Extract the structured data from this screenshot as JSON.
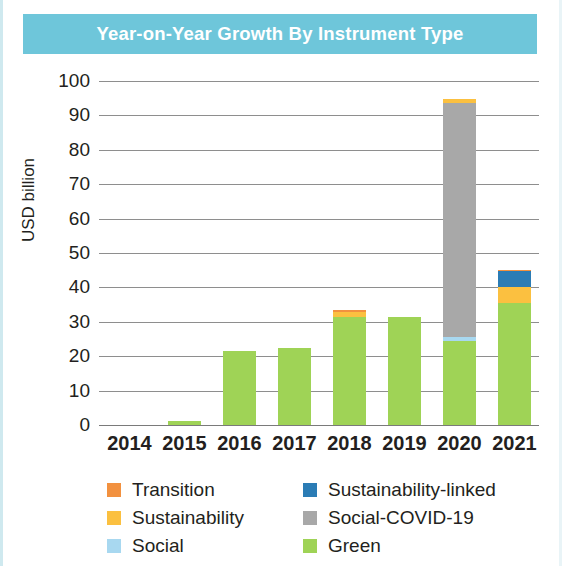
{
  "title": "Year-on-Year Growth By Instrument Type",
  "colors": {
    "title_band": "#6ec6da",
    "transition": "#f2913f",
    "sustainability": "#fbc040",
    "social": "#a8d8f0",
    "sustainability_linked": "#2b7cb5",
    "social_covid_19": "#a8a8a8",
    "green": "#9fd356"
  },
  "legend": {
    "left": [
      {
        "label": "Transition",
        "color_key": "transition"
      },
      {
        "label": "Sustainability",
        "color_key": "sustainability"
      },
      {
        "label": "Social",
        "color_key": "social"
      }
    ],
    "right": [
      {
        "label": "Sustainability-linked",
        "color_key": "sustainability_linked"
      },
      {
        "label": "Social-COVID-19",
        "color_key": "social_covid_19"
      },
      {
        "label": "Green",
        "color_key": "green"
      }
    ]
  },
  "chart_data": {
    "type": "bar",
    "subtype": "stacked",
    "title": "Year-on-Year Growth By Instrument Type",
    "xlabel": "",
    "ylabel": "USD billion",
    "ylim": [
      0,
      100
    ],
    "yticks": [
      0,
      10,
      20,
      30,
      40,
      50,
      60,
      70,
      80,
      90,
      100
    ],
    "ytick_labels": [
      "0",
      "10",
      "20",
      "30",
      "40",
      "50",
      "60",
      "70",
      "80",
      "90",
      "100"
    ],
    "grid": true,
    "legend_position": "bottom",
    "categories": [
      "2014",
      "2015",
      "2016",
      "2017",
      "2018",
      "2019",
      "2020",
      "2021"
    ],
    "series": [
      {
        "name": "Green",
        "color_key": "green",
        "values": [
          0,
          1.3,
          21.5,
          22.5,
          31.5,
          31.5,
          24.5,
          35.5
        ]
      },
      {
        "name": "Social",
        "color_key": "social",
        "values": [
          0,
          0,
          0,
          0,
          0,
          0,
          1.0,
          0
        ]
      },
      {
        "name": "Social-COVID-19",
        "color_key": "social_covid_19",
        "values": [
          0,
          0,
          0,
          0,
          0,
          0,
          68.0,
          0
        ]
      },
      {
        "name": "Sustainability",
        "color_key": "sustainability",
        "values": [
          0,
          0,
          0,
          0,
          1.3,
          0,
          1.3,
          4.5
        ]
      },
      {
        "name": "Sustainability-linked",
        "color_key": "sustainability_linked",
        "values": [
          0,
          0,
          0,
          0,
          0,
          0,
          0,
          4.8
        ]
      },
      {
        "name": "Transition",
        "color_key": "transition",
        "values": [
          0,
          0,
          0,
          0,
          0.5,
          0,
          0,
          0.3
        ]
      }
    ],
    "totals": [
      0,
      1.3,
      21.5,
      22.5,
      33.3,
      31.5,
      94.8,
      45.1
    ]
  }
}
